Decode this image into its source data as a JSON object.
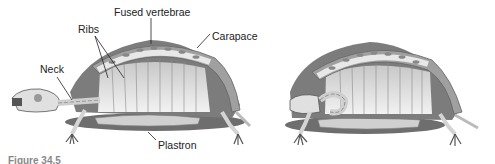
{
  "figure": {
    "labels": {
      "fused_vertebrae": "Fused vertebrae",
      "ribs": "Ribs",
      "carapace": "Carapace",
      "neck": "Neck",
      "plastron": "Plastron"
    },
    "caption_fragment": "Figure 34.5"
  },
  "colors": {
    "shell_dark": "#6e6e6e",
    "shell_mid": "#9a9a9a",
    "bone": "#e6e6e6",
    "rib_bg": "#d8d8d8",
    "text": "#222222"
  }
}
